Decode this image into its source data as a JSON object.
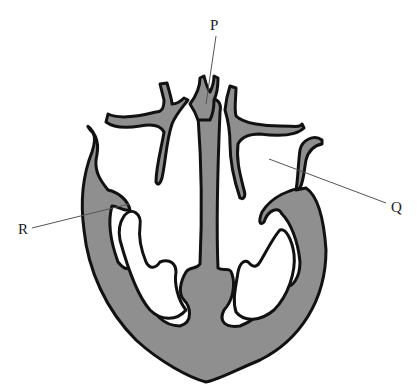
{
  "diagram": {
    "fill_color": "#8f8f8f",
    "outline_color": "#111111",
    "labels": [
      {
        "id": "P",
        "text": "P",
        "x": 214,
        "y": 20,
        "points_to": [
          206,
          104
        ]
      },
      {
        "id": "Q",
        "text": "Q",
        "x": 392,
        "y": 205,
        "points_to": [
          269,
          159
        ]
      },
      {
        "id": "R",
        "text": "R",
        "x": 22,
        "y": 230,
        "points_to": [
          129,
          204
        ]
      }
    ]
  }
}
